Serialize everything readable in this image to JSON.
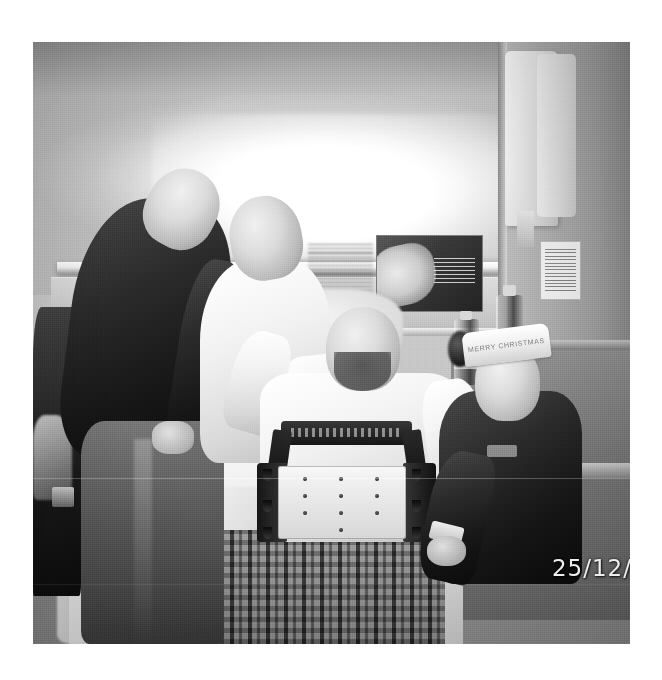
{
  "page": {
    "background_color": "#ffffff",
    "width": 662,
    "height": 680
  },
  "photograph": {
    "kind": "scanned-photograph",
    "description": "Black and white photograph of four men in a hospital ward; a patient sits up in a hospital bed wearing a white t-shirt and a rigid torso brace, flanked by three visitors.",
    "color_mode": "grayscale",
    "frame": {
      "x": 33,
      "y": 42,
      "width": 597,
      "height": 602
    },
    "border_color": "#ffffff",
    "date_stamp": "25/12/",
    "date_stamp_note": "camera date imprint, clipped at right edge of photo",
    "date_stamp_color": "#e9e9e9"
  },
  "scene": {
    "setting": "hospital ward bed bay",
    "subjects": [
      {
        "id": "man-left-partial",
        "label": "partially cropped person at left edge",
        "clothing": "dark clothing",
        "position": "far left edge"
      },
      {
        "id": "man-leather-jacket",
        "label": "man in dark leather jacket leaning over bed",
        "clothing": "dark leather jacket and jeans",
        "position": "left"
      },
      {
        "id": "man-white-top",
        "label": "man in white top standing behind bed",
        "clothing": "white t-shirt",
        "position": "centre left"
      },
      {
        "id": "patient",
        "label": "patient in hospital bed wearing torso brace",
        "clothing": "white t-shirt, rigid back brace, checked pyjama trousers",
        "position": "centre"
      },
      {
        "id": "man-christmas-headband",
        "label": "young man seated at right wearing Merry Christmas headband",
        "clothing": "dark hooded jacket",
        "position": "right"
      }
    ],
    "objects": [
      {
        "id": "overhead-light",
        "label": "overhead strip light above bed"
      },
      {
        "id": "wall-rail",
        "label": "service rail with power sockets and gas outlets"
      },
      {
        "id": "wall-poster",
        "label": "information poster on wall"
      },
      {
        "id": "towel",
        "label": "white towel hanging on pillar"
      },
      {
        "id": "notice",
        "label": "printed notice taped to pillar"
      },
      {
        "id": "bedside-cabinet",
        "label": "bedside cabinet"
      },
      {
        "id": "water-bottles",
        "label": "two plastic drink bottles on cabinet"
      },
      {
        "id": "bed-linen",
        "label": "white bed sheets and blanket"
      }
    ],
    "headband_text": "MERRY CHRISTMAS"
  }
}
